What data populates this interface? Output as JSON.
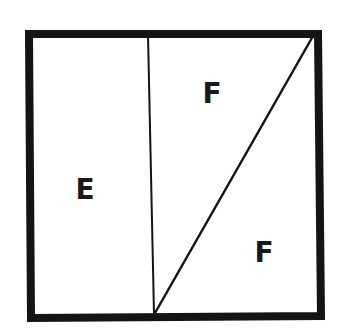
{
  "diagram": {
    "type": "partitioned-square",
    "colors": {
      "background": "#ffffff",
      "stroke": "#141414",
      "label": "#1a1a1a"
    },
    "outer_square": {
      "corners": {
        "top_left": [
          29,
          34
        ],
        "top_right": [
          318,
          34
        ],
        "bottom_right": [
          321,
          316
        ],
        "bottom_left": [
          31,
          318
        ]
      },
      "border_width": 8
    },
    "divider_vertical": {
      "from": [
        148,
        35
      ],
      "to": [
        154,
        314
      ],
      "stroke_width": 2
    },
    "divider_diagonal": {
      "from": [
        313,
        36
      ],
      "to": [
        155,
        313
      ],
      "stroke_width": 2.5
    },
    "regions": [
      {
        "id": "left-rectangle",
        "label": "E",
        "position": [
          85,
          199
        ]
      },
      {
        "id": "upper-triangle",
        "label": "F",
        "position": [
          212,
          103
        ]
      },
      {
        "id": "lower-triangle",
        "label": "F",
        "position": [
          264,
          262
        ]
      }
    ]
  }
}
